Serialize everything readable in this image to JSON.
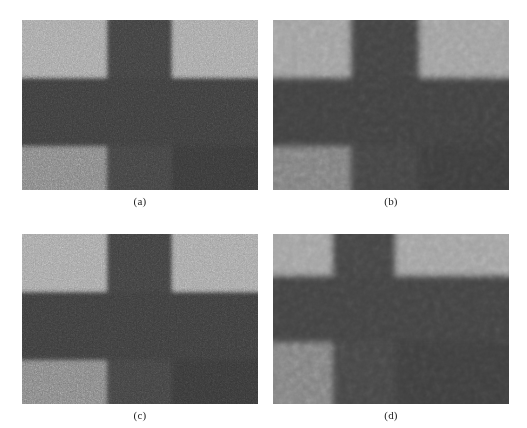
{
  "figure": {
    "background_color": "#ffffff",
    "layout": "2x2-grid",
    "panel_count": 4
  },
  "palette": {
    "background_light": "#9a9a9a",
    "mid_gray": "#787878",
    "dark_gray": "#3a3a3a",
    "darker_gray": "#303030",
    "caption_color": "#222222"
  },
  "panels": [
    {
      "id": "panel-a",
      "caption": "(a)",
      "noise_level": "high",
      "smoothing": "none",
      "description": "Noisy grayscale image of a cross-shaped object",
      "x": 22,
      "y": 20,
      "width": 236,
      "height": 170,
      "base_color": "#9a9a9a",
      "regions": [
        {
          "name": "top-left-background",
          "x": 0,
          "y": 0,
          "w": 85,
          "h": 58,
          "color": "#9c9c9c"
        },
        {
          "name": "vertical-bar-top",
          "x": 85,
          "y": 0,
          "w": 65,
          "h": 58,
          "color": "#3b3b3b"
        },
        {
          "name": "top-right-background",
          "x": 150,
          "y": 0,
          "w": 86,
          "h": 58,
          "color": "#9c9c9c"
        },
        {
          "name": "horizontal-bar",
          "x": 0,
          "y": 58,
          "w": 236,
          "h": 68,
          "color": "#383838"
        },
        {
          "name": "bottom-left-midtone",
          "x": 0,
          "y": 126,
          "w": 85,
          "h": 44,
          "color": "#7a7a7a"
        },
        {
          "name": "vertical-bar-bottom",
          "x": 85,
          "y": 126,
          "w": 65,
          "h": 44,
          "color": "#3d3d3d"
        },
        {
          "name": "bottom-right-dark",
          "x": 150,
          "y": 126,
          "w": 86,
          "h": 44,
          "color": "#343434"
        }
      ]
    },
    {
      "id": "panel-b",
      "caption": "(b)",
      "noise_level": "low",
      "smoothing": "strong",
      "description": "Denoised / filtered version of the cross-shaped object",
      "x": 273,
      "y": 20,
      "width": 236,
      "height": 170,
      "base_color": "#9a9a9a",
      "regions": [
        {
          "name": "top-left-background",
          "x": 0,
          "y": 0,
          "w": 78,
          "h": 58,
          "color": "#a0a0a0"
        },
        {
          "name": "vertical-bar-top",
          "x": 78,
          "y": 0,
          "w": 68,
          "h": 58,
          "color": "#434343"
        },
        {
          "name": "top-right-background",
          "x": 146,
          "y": 0,
          "w": 90,
          "h": 58,
          "color": "#a0a0a0"
        },
        {
          "name": "horizontal-bar",
          "x": 0,
          "y": 58,
          "w": 236,
          "h": 68,
          "color": "#414141"
        },
        {
          "name": "bottom-left-midtone",
          "x": 0,
          "y": 126,
          "w": 78,
          "h": 44,
          "color": "#808080"
        },
        {
          "name": "vertical-bar-bottom",
          "x": 78,
          "y": 126,
          "w": 68,
          "h": 44,
          "color": "#454545"
        },
        {
          "name": "bottom-right-dark",
          "x": 146,
          "y": 126,
          "w": 90,
          "h": 44,
          "color": "#3d3d3d"
        }
      ]
    },
    {
      "id": "panel-c",
      "caption": "(c)",
      "noise_level": "high",
      "smoothing": "none",
      "description": "Noisy grayscale image of a cross-shaped object",
      "x": 22,
      "y": 234,
      "width": 236,
      "height": 170,
      "base_color": "#9a9a9a",
      "regions": [
        {
          "name": "top-left-background",
          "x": 0,
          "y": 0,
          "w": 85,
          "h": 58,
          "color": "#9c9c9c"
        },
        {
          "name": "vertical-bar-top",
          "x": 85,
          "y": 0,
          "w": 65,
          "h": 58,
          "color": "#3b3b3b"
        },
        {
          "name": "top-right-background",
          "x": 150,
          "y": 0,
          "w": 86,
          "h": 58,
          "color": "#9c9c9c"
        },
        {
          "name": "horizontal-bar",
          "x": 0,
          "y": 58,
          "w": 236,
          "h": 68,
          "color": "#383838"
        },
        {
          "name": "bottom-left-midtone",
          "x": 0,
          "y": 126,
          "w": 85,
          "h": 44,
          "color": "#7a7a7a"
        },
        {
          "name": "vertical-bar-bottom",
          "x": 85,
          "y": 126,
          "w": 65,
          "h": 44,
          "color": "#3d3d3d"
        },
        {
          "name": "bottom-right-dark",
          "x": 150,
          "y": 126,
          "w": 86,
          "h": 44,
          "color": "#343434"
        }
      ]
    },
    {
      "id": "panel-d",
      "caption": "(d)",
      "noise_level": "low",
      "smoothing": "strong",
      "description": "Denoised / filtered version of the cross-shaped object",
      "x": 273,
      "y": 234,
      "width": 236,
      "height": 170,
      "base_color": "#9a9a9a",
      "regions": [
        {
          "name": "top-left-background",
          "x": 0,
          "y": 0,
          "w": 60,
          "h": 42,
          "color": "#a2a2a2"
        },
        {
          "name": "vertical-bar-top",
          "x": 60,
          "y": 0,
          "w": 62,
          "h": 42,
          "color": "#454545"
        },
        {
          "name": "top-right-background",
          "x": 122,
          "y": 0,
          "w": 114,
          "h": 42,
          "color": "#a2a2a2"
        },
        {
          "name": "horizontal-bar",
          "x": 0,
          "y": 42,
          "w": 236,
          "h": 66,
          "color": "#434343"
        },
        {
          "name": "bottom-left-midtone",
          "x": 0,
          "y": 108,
          "w": 60,
          "h": 62,
          "color": "#828282"
        },
        {
          "name": "vertical-bar-bottom",
          "x": 60,
          "y": 108,
          "w": 62,
          "h": 62,
          "color": "#474747"
        },
        {
          "name": "bottom-right-dark",
          "x": 122,
          "y": 108,
          "w": 114,
          "h": 62,
          "color": "#3f3f3f"
        }
      ]
    }
  ]
}
